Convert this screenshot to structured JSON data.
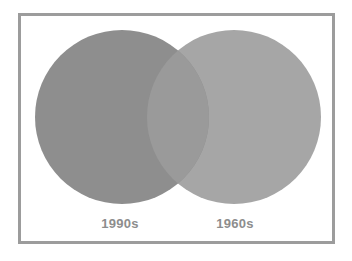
{
  "figure": {
    "type": "venn-diagram",
    "background_color": "#ffffff",
    "frame": {
      "border_color": "#9c9c9c",
      "border_width_px": 3,
      "fill_color": "#ffffff"
    }
  },
  "chart_data": {
    "type": "venn",
    "title": "",
    "subtitle": "",
    "xlabel": "",
    "ylabel": "",
    "legend_position": "none",
    "grid": false,
    "sets": [
      {
        "id": "set-left",
        "label": "1990s",
        "fill_color": "#8e8e8e",
        "center_x": 122,
        "center_y": 117,
        "radius": 87,
        "label_x": 120,
        "label_y": 228
      },
      {
        "id": "set-right",
        "label": "1960s",
        "fill_color": "#a6a6a6",
        "center_x": 234,
        "center_y": 117,
        "radius": 87,
        "label_x": 235,
        "label_y": 228
      }
    ],
    "intersection": {
      "id": "set-intersection",
      "label": "",
      "fill_color": "#9a9a9a",
      "top_point_x": 178,
      "top_point_y": 45,
      "bottom_point_x": 178,
      "bottom_point_y": 190
    },
    "categories": [
      "1990s",
      "1960s"
    ],
    "label_color": "#8d8d8d"
  },
  "labels": {
    "left": "1990s",
    "right": "1960s"
  }
}
